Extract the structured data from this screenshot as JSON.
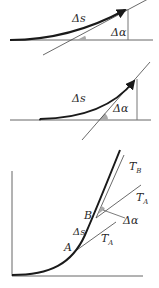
{
  "figure": {
    "panels": [
      {
        "id": "top",
        "labels": {
          "arc": "Δs",
          "angle": "Δα"
        }
      },
      {
        "id": "middle",
        "labels": {
          "arc": "Δs",
          "angle": "Δα"
        }
      },
      {
        "id": "bottom",
        "labels": {
          "point_a": "A",
          "point_b": "B",
          "arc": "Δs",
          "angle": "Δα",
          "tangent_b_main": "T",
          "tangent_b_sub": "B",
          "tangent_a_upper_main": "T",
          "tangent_a_upper_sub": "A",
          "tangent_a_lower_main": "T",
          "tangent_a_lower_sub": "A"
        }
      }
    ],
    "colors": {
      "curve": "#1a1a1a",
      "line": "#555555",
      "angle_fill": "#a9a9a9"
    }
  }
}
